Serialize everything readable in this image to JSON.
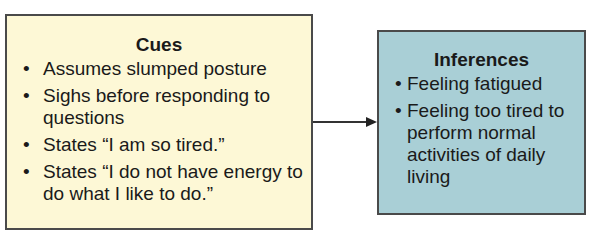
{
  "cues": {
    "title": "Cues",
    "items": [
      "Assumes slumped posture",
      "Sighs before responding to questions",
      "States “I am so tired.”",
      "States “I do not have energy to do what I like to do.”"
    ]
  },
  "inferences": {
    "title": "Inferences",
    "items": [
      "Feeling fatigued",
      "Feeling too tired to perform normal activities of daily living"
    ]
  },
  "bullet": "•",
  "colors": {
    "cues_bg": "#fdf8d6",
    "inferences_bg": "#a9cfd6",
    "border": "#4a4a4a"
  }
}
